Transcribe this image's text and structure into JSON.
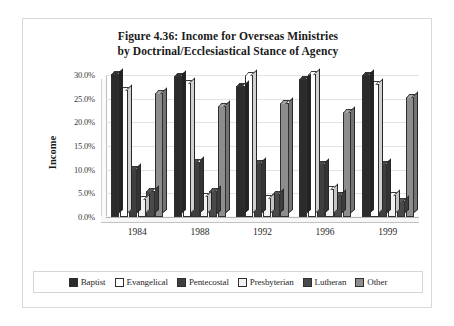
{
  "figure": {
    "title_line1": "Figure 4.36: Income for Overseas Ministries",
    "title_line2": "by Doctrinal/Ecclesiastical Stance of Agency"
  },
  "axes": {
    "y_title": "Income",
    "y_ticks": [
      "0.0%",
      "5.0%",
      "10.0%",
      "15.0%",
      "20.0%",
      "25.0%",
      "30.0%"
    ],
    "x_ticks": [
      "1984",
      "1988",
      "1992",
      "1996",
      "1999"
    ]
  },
  "legend": {
    "position": "bottom",
    "items": [
      {
        "label": "Baptist",
        "color": "#2b2b2b"
      },
      {
        "label": "Evangelical",
        "color": "#ffffff"
      },
      {
        "label": "Pentecostal",
        "color": "#3f3f3f"
      },
      {
        "label": "Presbyterian",
        "color": "#f2f2f2"
      },
      {
        "label": "Lutheran",
        "color": "#4a4a4a"
      },
      {
        "label": "Other",
        "color": "#8d8d8d"
      }
    ]
  },
  "chart_data": {
    "type": "bar",
    "title": "Figure 4.36: Income for Overseas Ministries by Doctrinal/Ecclesiastical Stance of Agency",
    "xlabel": "",
    "ylabel": "Income",
    "ylim": [
      0,
      30
    ],
    "yunit": "%",
    "ytick_step": 5,
    "grid": true,
    "categories": [
      "1984",
      "1988",
      "1992",
      "1996",
      "1999"
    ],
    "series": [
      {
        "name": "Baptist",
        "color": "#2b2b2b",
        "values": [
          30.2,
          29.8,
          27.6,
          29.1,
          30.0
        ]
      },
      {
        "name": "Evangelical",
        "color": "#ffffff",
        "values": [
          26.8,
          28.4,
          30.1,
          30.2,
          28.2
        ]
      },
      {
        "name": "Pentecostal",
        "color": "#3f3f3f",
        "values": [
          10.2,
          11.6,
          11.5,
          11.1,
          11.2
        ]
      },
      {
        "name": "Presbyterian",
        "color": "#f2f2f2",
        "values": [
          3.9,
          4.4,
          4.1,
          6.0,
          4.6
        ]
      },
      {
        "name": "Lutheran",
        "color": "#4a4a4a",
        "values": [
          5.5,
          5.6,
          4.9,
          4.7,
          3.3
        ]
      },
      {
        "name": "Other",
        "color": "#8d8d8d",
        "values": [
          26.3,
          23.4,
          24.0,
          22.1,
          25.4
        ]
      }
    ]
  }
}
